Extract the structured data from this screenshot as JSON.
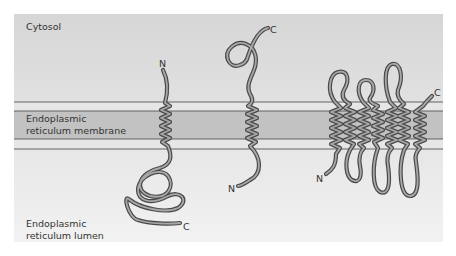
{
  "figure": {
    "regions": {
      "cytosol": "Cytosol",
      "membrane_line1": "Endoplasmic",
      "membrane_line2": "reticulum membrane",
      "lumen_line1": "Endoplasmic",
      "lumen_line2": "reticulum lumen"
    },
    "proteins": [
      {
        "name": "single-pass protein (N cytosolic)",
        "top_terminus": "N",
        "bottom_terminus": "C"
      },
      {
        "name": "single-pass protein (C cytosolic)",
        "top_terminus": "C",
        "bottom_terminus": "N"
      },
      {
        "name": "multi-pass protein",
        "top_terminus": "C",
        "bottom_terminus": "N",
        "helix_count": "7"
      }
    ],
    "colors": {
      "panel_top": "#d6d6d6",
      "panel_bottom": "#f2f2f2",
      "membrane_core": "#c2c2c2",
      "membrane_edge": "#e6e6e6",
      "membrane_line": "#555555",
      "strand_outline": "#4a4a4a",
      "strand_fill": "#a8a8a8"
    }
  }
}
